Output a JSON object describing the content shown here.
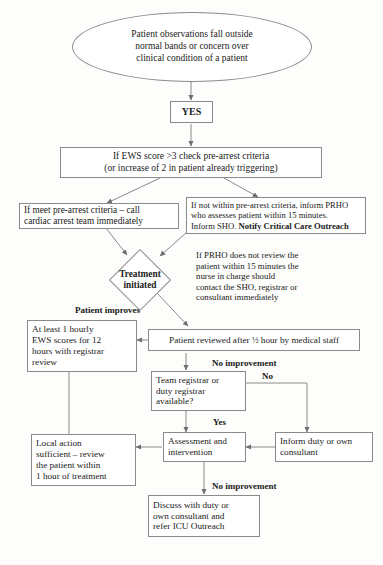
{
  "diagram": {
    "start": {
      "line1": "Patient observations fall outside",
      "line2": "normal bands or concern over",
      "line3": "clinical condition of a patient"
    },
    "yes_gate": "YES",
    "ews_check": {
      "line1": "If EWS score >3 check pre-arrest criteria",
      "line2": "(or increase of 2 in patient already triggering)"
    },
    "meet_criteria": {
      "line1": "If meet pre-arrest criteria – call",
      "line2": "cardiac arrest team immediately"
    },
    "not_within_criteria": {
      "line1": "If not within pre-arrest criteria, inform PRHO",
      "line2": "who assesses patient within 15 minutes.",
      "line3_plain": "Inform SHO. ",
      "line3_bold": "Notify Critical Care Outreach"
    },
    "treatment_initiated": {
      "line1": "Treatment",
      "line2": "initiated"
    },
    "prho_note": {
      "line1": "If PRHO does not review the",
      "line2": "patient within 15 minutes the",
      "line3": "nurse in charge should",
      "line4": "contact the SHO, registrar or",
      "line5": "consultant immediately"
    },
    "patient_improves_label": "Patient improves",
    "hourly_ews": {
      "line1": "At least 1 hourly",
      "line2": "EWS scores for 12",
      "line3": "hours with registrar",
      "line4": "review"
    },
    "patient_reviewed": {
      "pre": "Patient reviewed after ",
      "fraction": "½",
      "post": " hour by medical staff"
    },
    "no_improvement_label_1": "No improvement",
    "registrar_available": {
      "line1": "Team registrar or",
      "line2": "duty registrar",
      "line3": "available?"
    },
    "no_label": "No",
    "yes_label": "Yes",
    "inform_duty": {
      "line1": "Inform duty or own",
      "line2": "consultant"
    },
    "assessment": {
      "line1": "Assessment and",
      "line2": "intervention"
    },
    "local_action": {
      "line1": "Local action",
      "line2": "sufficient – review",
      "line3": "the patient within",
      "line4": "1 hour of treatment"
    },
    "no_improvement_label_2": "No improvement",
    "discuss_icu": {
      "line1": "Discuss with duty or",
      "line2": "own consultant and",
      "line3": "refer ICU Outreach"
    },
    "caption": "",
    "colors": {
      "stroke": "#8a8a8a",
      "text": "#1a1a1a",
      "background": "#fdfdfb"
    }
  }
}
